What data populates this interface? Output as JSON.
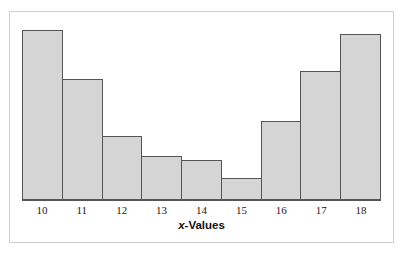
{
  "figure": {
    "kind": "histogram-figure",
    "frame_border_color": "#cfcfcf",
    "background_color": "#ffffff"
  },
  "axis": {
    "title_prefix": "x",
    "title_suffix": "-Values",
    "title_full": "x-Values",
    "line_color": "#555555"
  },
  "style": {
    "bar_fill": "#d5d5d5",
    "bar_stroke": "#555555",
    "label_color": "#1a1a1a"
  },
  "chart_data": {
    "type": "bar",
    "title": "",
    "subtitle": "",
    "xlabel": "x-Values",
    "ylabel": "",
    "categories": [
      "10",
      "11",
      "12",
      "13",
      "14",
      "15",
      "16",
      "17",
      "18"
    ],
    "values": [
      170,
      121,
      64,
      44,
      40,
      22,
      79,
      129,
      166
    ],
    "values_normalized": [
      1.0,
      0.71,
      0.38,
      0.26,
      0.24,
      0.13,
      0.46,
      0.76,
      0.98
    ],
    "ylim": [
      0,
      176
    ],
    "xlim": [
      9.5,
      18.5
    ],
    "bin_width": 1,
    "grid": false,
    "legend": false,
    "legend_position": "none",
    "y_axis_visible": false,
    "x_axis_visible": true,
    "shape_description": "U-shaped (bimodal at the extremes) distribution",
    "bars": [
      {
        "category": "10",
        "value": 170,
        "pixel_top": 30,
        "pixel_height": 170
      },
      {
        "category": "11",
        "value": 121,
        "pixel_top": 79,
        "pixel_height": 121
      },
      {
        "category": "12",
        "value": 64,
        "pixel_top": 136,
        "pixel_height": 64
      },
      {
        "category": "13",
        "value": 44,
        "pixel_top": 156,
        "pixel_height": 44
      },
      {
        "category": "14",
        "value": 40,
        "pixel_top": 160,
        "pixel_height": 40
      },
      {
        "category": "15",
        "value": 22,
        "pixel_top": 178,
        "pixel_height": 22
      },
      {
        "category": "16",
        "value": 79,
        "pixel_top": 121,
        "pixel_height": 79
      },
      {
        "category": "17",
        "value": 129,
        "pixel_top": 71,
        "pixel_height": 129
      },
      {
        "category": "18",
        "value": 166,
        "pixel_top": 34,
        "pixel_height": 166
      }
    ]
  }
}
